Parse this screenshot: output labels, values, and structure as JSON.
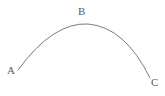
{
  "figure": {
    "type": "geometric-arc-diagram",
    "background_color": "#ffffff",
    "width": 165,
    "height": 96,
    "stroke_color": "#7a7a7a",
    "stroke_width": 1,
    "label_color": "#5c5c5c",
    "labels": {
      "a": "A",
      "b": "B",
      "c": "C"
    },
    "points": [
      {
        "name": "A",
        "label": "A",
        "x": 18,
        "y": 70,
        "label_x": 7,
        "label_y": 65,
        "role": "arc-start-endpoint"
      },
      {
        "name": "B",
        "label": "B",
        "x": 88,
        "y": 24,
        "label_x": 78,
        "label_y": 6,
        "role": "arc-apex"
      },
      {
        "name": "C",
        "label": "C",
        "x": 150,
        "y": 78,
        "label_x": 151,
        "label_y": 77,
        "role": "arc-end-endpoint"
      }
    ],
    "arc": {
      "path": "M 18 70 Q 53 22 88 24 Q 125 27 150 78",
      "description": "Single smooth concave-down arc from A through B to C"
    }
  }
}
